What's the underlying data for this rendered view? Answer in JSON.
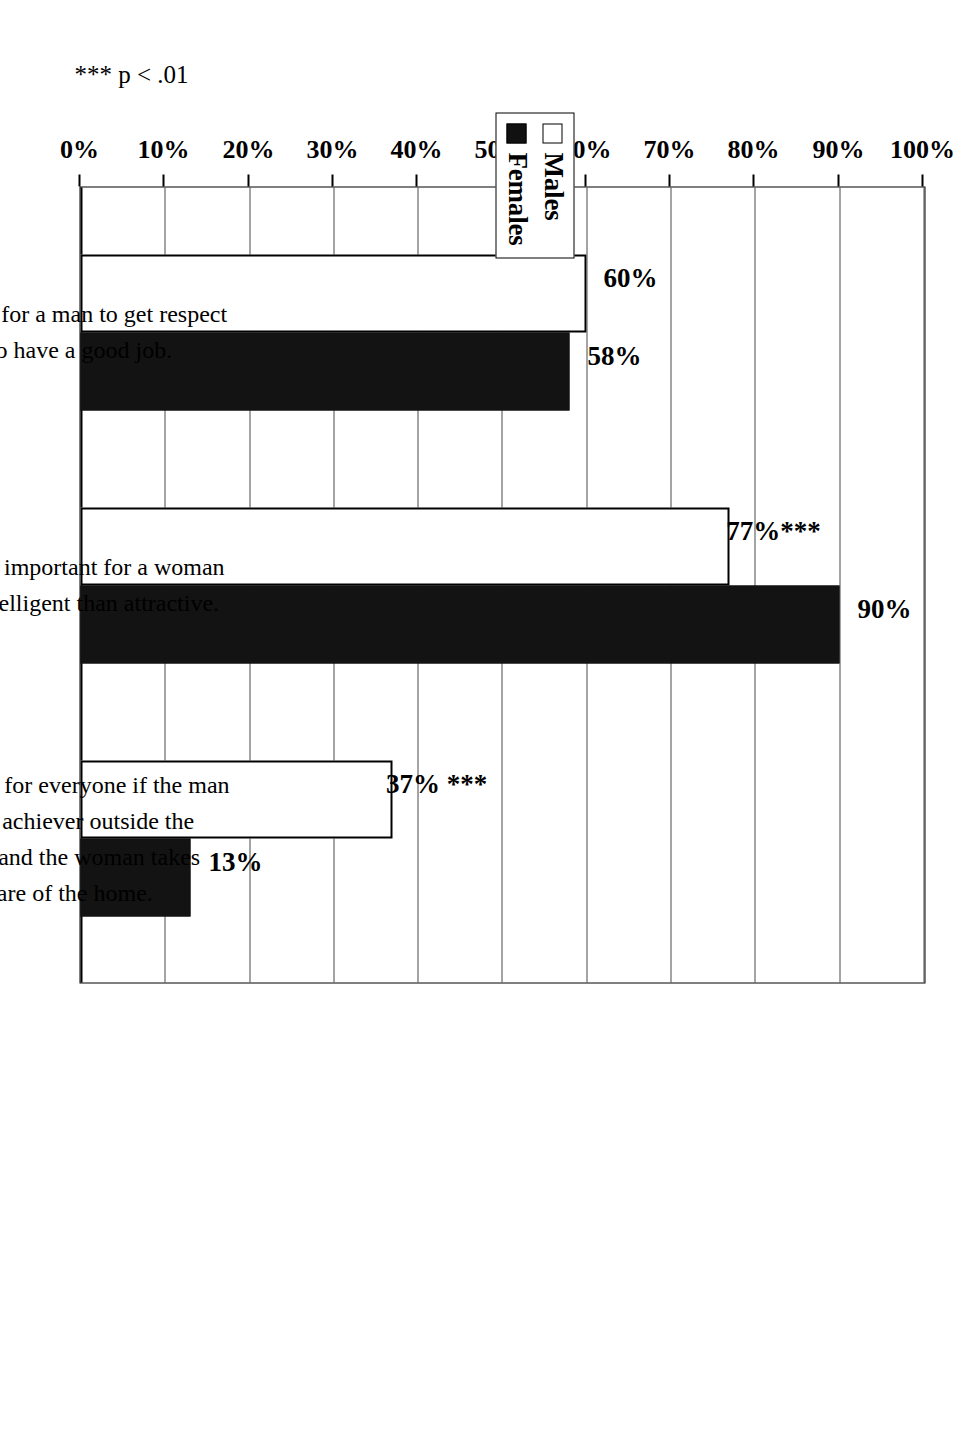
{
  "chart_data": {
    "type": "bar",
    "title": "",
    "subtitle": "",
    "xlabel": "",
    "ylabel": "",
    "ylim": [
      0,
      100
    ],
    "grid": true,
    "orientation": "rotated-90-ccw",
    "legend_position": "top-outside",
    "categories": [
      "The way for a man to get respect\nis to have a good job.",
      "It's more important for a woman\nto be intelligent than attractive.",
      "It's better for everyone if the man\nis the achiever outside the\nhome and the woman takes\ncare of the home."
    ],
    "category_lines": [
      [
        "The way for a man to get respect",
        "is to have a good job."
      ],
      [
        "It's more important for a woman",
        "to be intelligent than attractive."
      ],
      [
        "It's better for everyone if the man",
        "is the achiever outside the",
        "home and the woman takes",
        "care of the home."
      ]
    ],
    "series": [
      {
        "name": "Males",
        "values": [
          60,
          77,
          37
        ],
        "color": "#ffffff",
        "swatch": "open"
      },
      {
        "name": "Females",
        "values": [
          58,
          90,
          13
        ],
        "color": "#131313",
        "swatch": "filled"
      }
    ],
    "data_labels": {
      "males": [
        "60%",
        "77%***",
        "37% ***"
      ],
      "females": [
        "58%",
        "90%",
        "13%"
      ]
    },
    "tick_labels": [
      "0%",
      "10%",
      "20%",
      "30%",
      "40%",
      "50%",
      "60%",
      "70%",
      "80%",
      "90%",
      "100%"
    ],
    "tick_values": [
      0,
      10,
      20,
      30,
      40,
      50,
      60,
      70,
      80,
      90,
      100
    ],
    "annotations": [
      "*** p < .01"
    ],
    "significance_note": "*** p < .01"
  },
  "legend": {
    "items": [
      {
        "label": "Males",
        "swatch": "open"
      },
      {
        "label": "Females",
        "swatch": "filled"
      }
    ]
  },
  "footnote": {
    "text": "*** p < .01"
  },
  "colors": {
    "males_fill": "#ffffff",
    "females_fill": "#131313",
    "outline": "#000000",
    "gridline": "#4a4a4a",
    "background": "#ffffff"
  }
}
